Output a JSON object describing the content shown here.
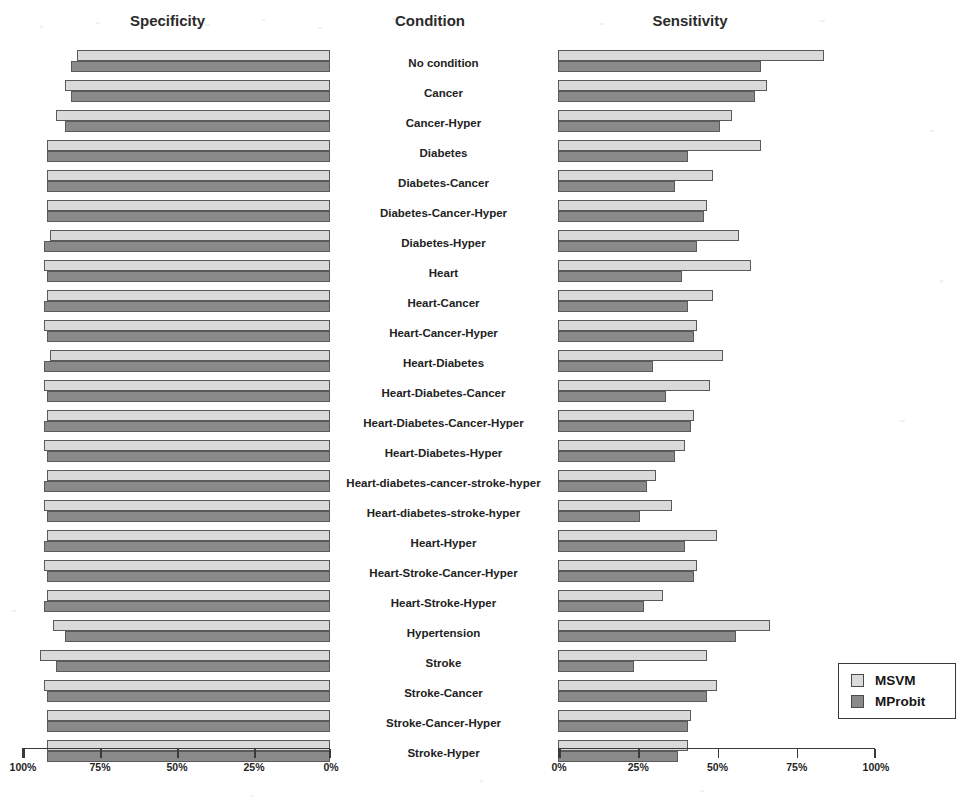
{
  "titles": {
    "left": "Specificity",
    "middle": "Condition",
    "right": "Sensitivity"
  },
  "legend": {
    "items": [
      {
        "label": "MSVM",
        "color": "#dadada",
        "name": "msvm"
      },
      {
        "label": "MProbit",
        "color": "#8a8a8a",
        "name": "mprobit"
      }
    ]
  },
  "axes": {
    "left": {
      "ticks": [
        "100%",
        "75%",
        "50%",
        "25%",
        "0%"
      ],
      "reversed": true,
      "min": 0,
      "max": 100
    },
    "right": {
      "ticks": [
        "0%",
        "25%",
        "50%",
        "75%",
        "100%"
      ],
      "reversed": false,
      "min": 0,
      "max": 100
    }
  },
  "chart_data": {
    "type": "bar",
    "orientation": "horizontal",
    "layout": "back-to-back paired panels (tornado / butterfly chart)",
    "title": "",
    "xlabel": "",
    "ylabel": "Condition",
    "grid": false,
    "legend_position": "bottom-right",
    "panels": [
      {
        "name": "Specificity",
        "axis": "left",
        "direction": "right-to-left",
        "xlim": [
          0,
          100
        ],
        "xticks": [
          100,
          75,
          50,
          25,
          0
        ],
        "unit": "%"
      },
      {
        "name": "Sensitivity",
        "axis": "right",
        "direction": "left-to-right",
        "xlim": [
          0,
          100
        ],
        "xticks": [
          0,
          25,
          50,
          75,
          100
        ],
        "unit": "%"
      }
    ],
    "categories": [
      "No condition",
      "Cancer",
      "Cancer-Hyper",
      "Diabetes",
      "Diabetes-Cancer",
      "Diabetes-Cancer-Hyper",
      "Diabetes-Hyper",
      "Heart",
      "Heart-Cancer",
      "Heart-Cancer-Hyper",
      "Heart-Diabetes",
      "Heart-Diabetes-Cancer",
      "Heart-Diabetes-Cancer-Hyper",
      "Heart-Diabetes-Hyper",
      "Heart-diabetes-cancer-stroke-hyper",
      "Heart-diabetes-stroke-hyper",
      "Heart-Hyper",
      "Heart-Stroke-Cancer-Hyper",
      "Heart-Stroke-Hyper",
      "Hypertension",
      "Stroke",
      "Stroke-Cancer",
      "Stroke-Cancer-Hyper",
      "Stroke-Hyper"
    ],
    "series": [
      {
        "name": "MSVM",
        "panel": "Specificity",
        "color": "#dadada",
        "values": [
          82,
          86,
          89,
          92,
          92,
          92,
          91,
          93,
          92,
          93,
          91,
          93,
          92,
          93,
          92,
          93,
          92,
          93,
          92,
          90,
          94,
          93,
          92,
          92
        ]
      },
      {
        "name": "MProbit",
        "panel": "Specificity",
        "color": "#8a8a8a",
        "values": [
          84,
          84,
          86,
          92,
          92,
          92,
          93,
          92,
          93,
          92,
          93,
          92,
          93,
          92,
          93,
          92,
          93,
          92,
          93,
          86,
          89,
          92,
          92,
          92
        ]
      },
      {
        "name": "MSVM",
        "panel": "Sensitivity",
        "color": "#dadada",
        "values": [
          84,
          66,
          55,
          64,
          49,
          47,
          57,
          61,
          49,
          44,
          52,
          48,
          43,
          40,
          31,
          36,
          50,
          44,
          33,
          67,
          47,
          50,
          42,
          41
        ]
      },
      {
        "name": "MProbit",
        "panel": "Sensitivity",
        "color": "#8a8a8a",
        "values": [
          64,
          62,
          51,
          41,
          37,
          46,
          44,
          39,
          41,
          43,
          30,
          34,
          42,
          37,
          28,
          26,
          40,
          43,
          27,
          56,
          24,
          47,
          41,
          38
        ]
      }
    ]
  }
}
